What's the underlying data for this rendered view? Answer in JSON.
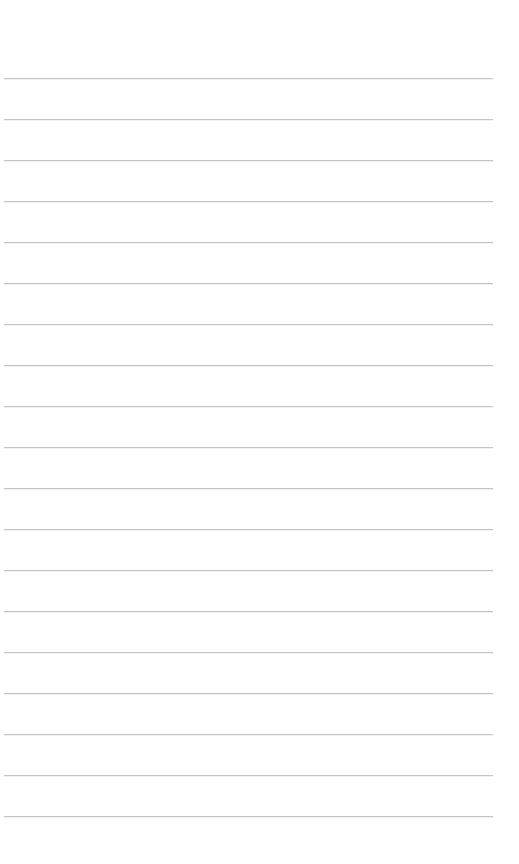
{
  "page": {
    "type": "lined-paper",
    "background_color": "#ffffff",
    "line_color": "#c4c4c4",
    "line_count": 19,
    "first_line_y": 78,
    "line_spacing": 41,
    "line_left": 4,
    "line_right": 493
  }
}
